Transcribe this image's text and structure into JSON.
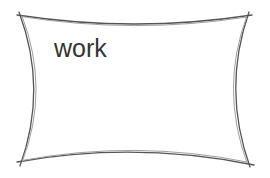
{
  "shape": {
    "type": "concave-rectangle",
    "label": "work",
    "stroke_color": "#555555",
    "inner_stroke_color": "#999999",
    "text_color": "#333333",
    "corners": {
      "top_left": [
        21,
        15
      ],
      "top_right": [
        247,
        16
      ],
      "bottom_right": [
        247,
        163
      ],
      "bottom_left": [
        22,
        161
      ]
    }
  }
}
